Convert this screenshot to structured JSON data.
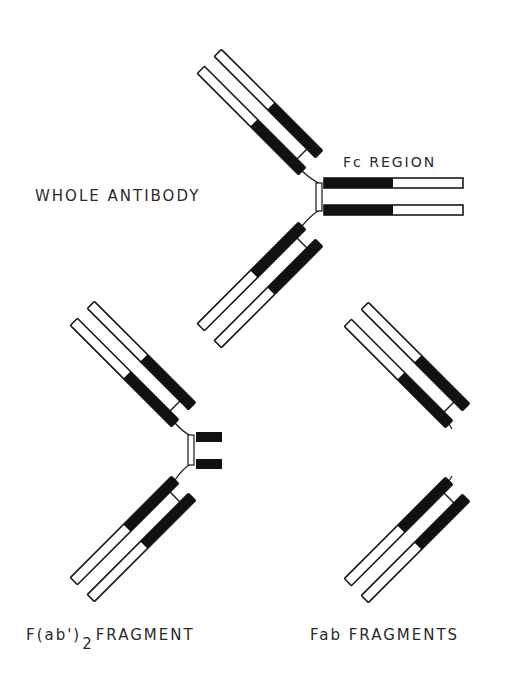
{
  "labels": {
    "whole_antibody": "WHOLE ANTIBODY",
    "fc_region": "Fc REGION",
    "fab2_prefix": "F(ab')",
    "fab2_subscript": "2",
    "fab2_suffix": "FRAGMENT",
    "fab_fragments": "Fab FRAGMENTS"
  },
  "colors": {
    "ink": "#1a1a1a",
    "fill_white": "#ffffff",
    "background": "#ffffff"
  },
  "diagram": {
    "structures": [
      {
        "name": "whole-antibody",
        "parts": [
          "two Fab arms",
          "hinge",
          "Fc region (two heavy-chain tails)"
        ]
      },
      {
        "name": "fab2-fragment",
        "parts": [
          "two Fab arms",
          "hinge",
          "short heavy-chain stubs"
        ]
      },
      {
        "name": "fab-fragments",
        "parts": [
          "two separate Fab arms"
        ]
      }
    ]
  }
}
